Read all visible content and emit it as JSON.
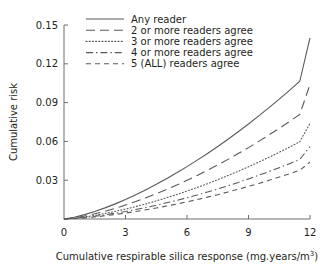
{
  "chart_data": {
    "type": "line",
    "title": "",
    "xlabel": "Cumulative respirable silica response (mg.years/m3)",
    "xlabel_parts": {
      "main": "Cumulative respirable silica response (mg.years/m",
      "sup": "3",
      "tail": ")"
    },
    "ylabel": "Cumulative risk",
    "xlim": [
      0,
      12
    ],
    "ylim": [
      0,
      0.15
    ],
    "xticks": [
      0,
      3,
      6,
      9,
      12
    ],
    "xtick_labels": [
      "0",
      "3",
      "6",
      "9",
      "12"
    ],
    "yticks": [
      0,
      0.03,
      0.06,
      0.09,
      0.12,
      0.15
    ],
    "ytick_labels": [
      "",
      "0.03",
      "0.06",
      "0.09",
      "0.12",
      "0.15"
    ],
    "grid": false,
    "legend_position": "top-left-inside",
    "x": [
      0,
      0.5,
      1,
      1.5,
      2,
      2.5,
      3,
      3.5,
      4,
      4.5,
      5,
      5.5,
      6,
      6.5,
      7,
      7.5,
      8,
      8.5,
      9,
      9.5,
      10,
      10.5,
      11,
      11.5,
      12
    ],
    "series": [
      {
        "name": "Any reader",
        "dash": "solid",
        "values": [
          0,
          0.0014,
          0.0034,
          0.0058,
          0.0086,
          0.0117,
          0.0151,
          0.0188,
          0.0227,
          0.0268,
          0.0312,
          0.0357,
          0.0405,
          0.0455,
          0.0507,
          0.0561,
          0.0617,
          0.0675,
          0.0735,
          0.0797,
          0.0861,
          0.0927,
          0.0995,
          0.1065,
          0.14
        ]
      },
      {
        "name": "2 or more readers agree",
        "dash": "long-dash",
        "values": [
          0,
          0.0009,
          0.0023,
          0.004,
          0.006,
          0.0083,
          0.0108,
          0.0135,
          0.0164,
          0.0195,
          0.0228,
          0.0262,
          0.0299,
          0.0337,
          0.0377,
          0.0418,
          0.0461,
          0.0506,
          0.0552,
          0.06,
          0.065,
          0.0701,
          0.0754,
          0.0808,
          0.104
        ]
      },
      {
        "name": "3 or more readers agree",
        "dash": "dotted",
        "values": [
          0,
          0.0006,
          0.0016,
          0.0028,
          0.0043,
          0.0059,
          0.0077,
          0.0096,
          0.0117,
          0.014,
          0.0164,
          0.0189,
          0.0216,
          0.0244,
          0.0273,
          0.0304,
          0.0336,
          0.0369,
          0.0404,
          0.044,
          0.0477,
          0.0516,
          0.0556,
          0.0597,
          0.074
        ]
      },
      {
        "name": "4 or more readers agree",
        "dash": "dash-dot",
        "values": [
          0,
          0.0005,
          0.0012,
          0.0021,
          0.0032,
          0.0045,
          0.0058,
          0.0073,
          0.0089,
          0.0106,
          0.0125,
          0.0144,
          0.0165,
          0.0186,
          0.0209,
          0.0232,
          0.0257,
          0.0283,
          0.031,
          0.0338,
          0.0367,
          0.0397,
          0.0428,
          0.046,
          0.056
        ]
      },
      {
        "name": "5 (ALL) readers agree",
        "dash": "dashed",
        "values": [
          0,
          0.0004,
          0.0009,
          0.0016,
          0.0025,
          0.0035,
          0.0046,
          0.0058,
          0.0071,
          0.0085,
          0.01,
          0.0116,
          0.0133,
          0.015,
          0.0169,
          0.0188,
          0.0209,
          0.023,
          0.0252,
          0.0275,
          0.0299,
          0.0324,
          0.035,
          0.0377,
          0.044
        ]
      }
    ]
  },
  "legend": {
    "items": [
      {
        "label": "Any reader"
      },
      {
        "label": "2 or more readers agree"
      },
      {
        "label": "3 or more readers agree"
      },
      {
        "label": "4 or more readers agree"
      },
      {
        "label": "5 (ALL) readers agree"
      }
    ]
  }
}
